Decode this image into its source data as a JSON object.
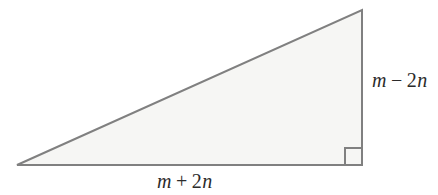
{
  "figure": {
    "name": "right-triangle-diagram",
    "background_color": "#ffffff",
    "shape": {
      "type": "right-triangle",
      "fill_color": "#f6f6f4",
      "stroke_color": "#808080",
      "stroke_width": 2,
      "vertices": {
        "bottom_left": [
          17,
          165
        ],
        "bottom_right": [
          362,
          165
        ],
        "top_right": [
          362,
          10
        ]
      },
      "right_angle_marker": {
        "corner": "bottom-right",
        "size": 17,
        "stroke_color": "#808080"
      }
    },
    "labels": {
      "vertical_side": {
        "full_text": "m − 2n",
        "variable_1": "m",
        "operator": "−",
        "coefficient": "2",
        "variable_2": "n",
        "position": "right-of-vertical-leg"
      },
      "horizontal_side": {
        "full_text": "m + 2n",
        "variable_1": "m",
        "operator": "+",
        "coefficient": "2",
        "variable_2": "n",
        "position": "below-horizontal-leg"
      }
    }
  }
}
